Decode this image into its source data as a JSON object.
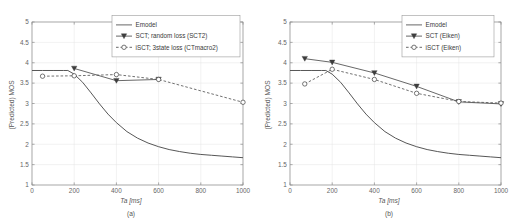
{
  "figure": {
    "background": "#ffffff",
    "line_color": "#4d4d4d",
    "grid_color": "#e4e4e4",
    "axis_color": "#8c8c8c"
  },
  "chart_data": [
    {
      "type": "line",
      "panel_label": "(a)",
      "title": "",
      "xlabel": "Ta [ms]",
      "ylabel": "(Predicted) MOS",
      "xlim": [
        0,
        1000
      ],
      "ylim": [
        1,
        5
      ],
      "xticks": [
        0,
        200,
        400,
        600,
        800,
        1000
      ],
      "xtick_labels": [
        "0",
        "200",
        "400",
        "600",
        "800",
        "1000"
      ],
      "yticks": [
        1,
        1.5,
        2,
        2.5,
        3,
        3.5,
        4,
        4.5,
        5
      ],
      "ytick_labels": [
        "1",
        "1.5",
        "2",
        "2.5",
        "3",
        "3.5",
        "4",
        "4.5",
        "5"
      ],
      "grid": true,
      "legend_position": "top-center",
      "series": [
        {
          "name": "Emodel",
          "style": "solid",
          "marker": "none",
          "x": [
            0,
            50,
            100,
            150,
            170,
            200,
            240,
            280,
            320,
            360,
            400,
            450,
            500,
            550,
            600,
            650,
            700,
            750,
            800,
            850,
            900,
            950,
            1000
          ],
          "values": [
            3.81,
            3.81,
            3.81,
            3.81,
            3.81,
            3.72,
            3.52,
            3.26,
            2.99,
            2.74,
            2.53,
            2.31,
            2.15,
            2.03,
            1.94,
            1.87,
            1.82,
            1.78,
            1.75,
            1.73,
            1.71,
            1.69,
            1.67
          ]
        },
        {
          "name": "SCT; random loss (SCT2)",
          "style": "solid",
          "marker": "triangle-down-filled",
          "x": [
            200,
            400,
            600
          ],
          "values": [
            3.86,
            3.56,
            3.59
          ]
        },
        {
          "name": "iSCT; 3state loss (CTmacro2)",
          "style": "dashed",
          "marker": "circle-open",
          "x": [
            50,
            200,
            400,
            600,
            1000
          ],
          "values": [
            3.67,
            3.68,
            3.71,
            3.59,
            3.03
          ]
        }
      ]
    },
    {
      "type": "line",
      "panel_label": "(b)",
      "title": "",
      "xlabel": "Ta [ms]",
      "ylabel": "(Predicted) MOS",
      "xlim": [
        0,
        1000
      ],
      "ylim": [
        1,
        5
      ],
      "xticks": [
        0,
        200,
        400,
        600,
        800,
        1000
      ],
      "xtick_labels": [
        "0",
        "200",
        "400",
        "600",
        "800",
        "1000"
      ],
      "yticks": [
        1,
        1.5,
        2,
        2.5,
        3,
        3.5,
        4,
        4.5,
        5
      ],
      "ytick_labels": [
        "1",
        "1.5",
        "2",
        "2.5",
        "3",
        "3.5",
        "4",
        "4.5",
        "5"
      ],
      "grid": true,
      "legend_position": "top-right",
      "series": [
        {
          "name": "Emodel",
          "style": "solid",
          "marker": "none",
          "x": [
            0,
            50,
            100,
            150,
            170,
            200,
            240,
            280,
            320,
            360,
            400,
            450,
            500,
            550,
            600,
            650,
            700,
            750,
            800,
            850,
            900,
            950,
            1000
          ],
          "values": [
            3.81,
            3.81,
            3.81,
            3.81,
            3.81,
            3.72,
            3.52,
            3.26,
            2.99,
            2.74,
            2.53,
            2.31,
            2.15,
            2.03,
            1.94,
            1.87,
            1.82,
            1.78,
            1.75,
            1.73,
            1.71,
            1.69,
            1.67
          ]
        },
        {
          "name": "SCT (Eiken)",
          "style": "solid",
          "marker": "triangle-down-filled",
          "x": [
            70,
            200,
            400,
            600,
            800,
            1000
          ],
          "values": [
            4.1,
            4.01,
            3.75,
            3.42,
            3.04,
            2.99
          ]
        },
        {
          "name": "iSCT (Eiken)",
          "style": "dashed",
          "marker": "circle-open",
          "x": [
            70,
            200,
            400,
            600,
            800,
            1000
          ],
          "values": [
            3.48,
            3.84,
            3.59,
            3.25,
            3.05,
            3.01
          ]
        }
      ]
    }
  ]
}
